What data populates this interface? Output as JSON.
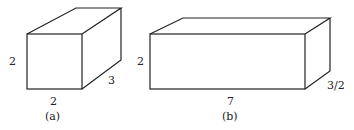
{
  "figure_a": {
    "height_label": "2",
    "width_label": "2",
    "depth_label": "3",
    "caption": "(a)"
  },
  "figure_b": {
    "height_label": "2",
    "width_label": "7",
    "depth_label": "3/2",
    "caption": "(b)"
  },
  "colors": {
    "stroke": "#222222",
    "background": "#ffffff"
  }
}
